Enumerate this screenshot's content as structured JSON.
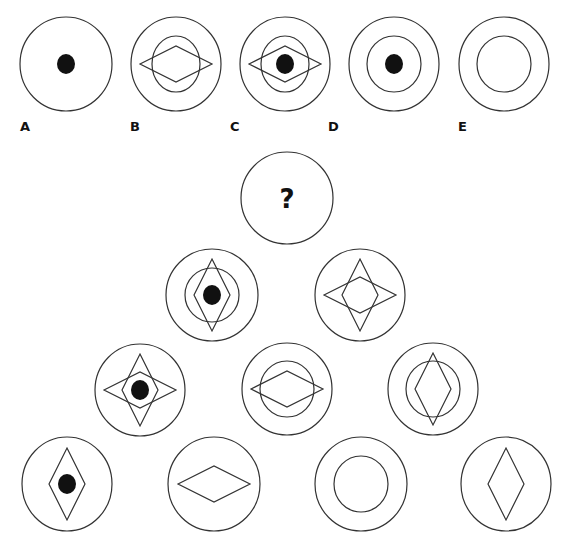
{
  "puzzle": {
    "type": "figure-matrix-pyramid",
    "stroke_color": "#333333",
    "dot_color": "#111111",
    "background": "#ffffff"
  },
  "options": [
    {
      "label": "A",
      "cx": 66,
      "cy": 64,
      "outer": [
        46,
        47
      ],
      "inner": null,
      "h_diamond": false,
      "v_diamond": false,
      "dot": true,
      "label_x": 20,
      "label_y": 120
    },
    {
      "label": "B",
      "cx": 176,
      "cy": 64,
      "outer": [
        45,
        47
      ],
      "inner": [
        24,
        28
      ],
      "h_diamond": true,
      "v_diamond": false,
      "dot": false,
      "label_x": 130,
      "label_y": 120
    },
    {
      "label": "C",
      "cx": 285,
      "cy": 64,
      "outer": [
        45,
        47
      ],
      "inner": [
        24,
        28
      ],
      "h_diamond": true,
      "v_diamond": false,
      "dot": true,
      "label_x": 230,
      "label_y": 120
    },
    {
      "label": "D",
      "cx": 394,
      "cy": 64,
      "outer": [
        45,
        47
      ],
      "inner": [
        27,
        28
      ],
      "h_diamond": false,
      "v_diamond": false,
      "dot": true,
      "label_x": 328,
      "label_y": 120
    },
    {
      "label": "E",
      "cx": 504,
      "cy": 64,
      "outer": [
        45,
        47
      ],
      "inner": [
        27,
        28
      ],
      "h_diamond": false,
      "v_diamond": false,
      "dot": false,
      "label_x": 458,
      "label_y": 120
    }
  ],
  "pyramid": {
    "question_mark": "?",
    "top": {
      "cx": 287,
      "cy": 198,
      "outer": [
        46,
        46
      ]
    },
    "cells": [
      {
        "row": 2,
        "col": 1,
        "cx": 212,
        "cy": 295,
        "outer": [
          46,
          46
        ],
        "inner": [
          27,
          27
        ],
        "h_diamond": false,
        "v_diamond": true,
        "dot": true
      },
      {
        "row": 2,
        "col": 2,
        "cx": 360,
        "cy": 295,
        "outer": [
          45,
          46
        ],
        "inner": null,
        "h_diamond": true,
        "v_diamond": true,
        "dot": false
      },
      {
        "row": 3,
        "col": 1,
        "cx": 140,
        "cy": 390,
        "outer": [
          45,
          46
        ],
        "inner": null,
        "h_diamond": true,
        "v_diamond": true,
        "dot": true
      },
      {
        "row": 3,
        "col": 2,
        "cx": 287,
        "cy": 389,
        "outer": [
          45,
          46
        ],
        "inner": [
          27,
          28
        ],
        "h_diamond": true,
        "v_diamond": false,
        "dot": false
      },
      {
        "row": 3,
        "col": 3,
        "cx": 433,
        "cy": 389,
        "outer": [
          45,
          46
        ],
        "inner": [
          27,
          28
        ],
        "h_diamond": false,
        "v_diamond": true,
        "dot": false
      },
      {
        "row": 4,
        "col": 1,
        "cx": 67,
        "cy": 484,
        "outer": [
          45,
          47
        ],
        "inner": null,
        "h_diamond": false,
        "v_diamond": true,
        "dot": true
      },
      {
        "row": 4,
        "col": 2,
        "cx": 214,
        "cy": 484,
        "outer": [
          46,
          47
        ],
        "inner": null,
        "h_diamond": true,
        "v_diamond": false,
        "dot": false
      },
      {
        "row": 4,
        "col": 3,
        "cx": 361,
        "cy": 484,
        "outer": [
          46,
          47
        ],
        "inner": [
          27,
          28
        ],
        "h_diamond": false,
        "v_diamond": false,
        "dot": false
      },
      {
        "row": 4,
        "col": 4,
        "cx": 506,
        "cy": 484,
        "outer": [
          45,
          47
        ],
        "inner": null,
        "h_diamond": false,
        "v_diamond": true,
        "dot": false
      }
    ]
  }
}
